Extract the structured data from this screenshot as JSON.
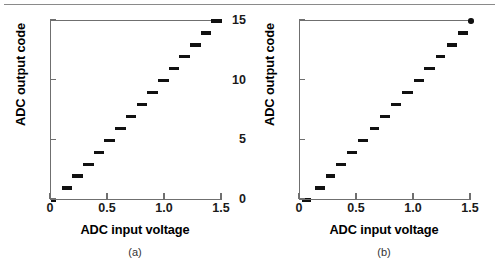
{
  "figure": {
    "divider_color": "#8a8a8a",
    "axis_color": "#6f6f6f",
    "data_color": "#111111"
  },
  "panels": [
    {
      "id": "a",
      "caption": "(a)",
      "xlabel": "ADC input voltage",
      "ylabel": "ADC output code"
    },
    {
      "id": "b",
      "caption": "(b)",
      "xlabel": "ADC input voltage",
      "ylabel": "ADC output code"
    }
  ],
  "ticks": {
    "x_labels": [
      "0",
      "0.5",
      "1.0",
      "1.5"
    ],
    "x_values": [
      0,
      0.5,
      1.0,
      1.5
    ],
    "y_labels": [
      "0",
      "5",
      "10",
      "15"
    ],
    "y_values": [
      0,
      5,
      10,
      15
    ]
  },
  "chart_data": [
    {
      "type": "line",
      "title": "(a)",
      "xlabel": "ADC input voltage",
      "ylabel": "ADC output code",
      "xlim": [
        0,
        1.5
      ],
      "ylim": [
        0,
        15
      ],
      "grid": false,
      "legend": "none",
      "description": "Ideal ADC transfer characteristic: 16 uniform code steps forming a staircase from code 0 to code 15 across 0 to 1.5 V input.",
      "series": [
        {
          "name": "ideal ADC transfer curve",
          "style": "staircase-steps",
          "steps": [
            {
              "code": 0,
              "x_start": 0.0,
              "x_end": 0.047
            },
            {
              "code": 1,
              "x_start": 0.094,
              "x_end": 0.188
            },
            {
              "code": 2,
              "x_start": 0.188,
              "x_end": 0.281
            },
            {
              "code": 3,
              "x_start": 0.281,
              "x_end": 0.375
            },
            {
              "code": 4,
              "x_start": 0.375,
              "x_end": 0.469
            },
            {
              "code": 5,
              "x_start": 0.469,
              "x_end": 0.562
            },
            {
              "code": 6,
              "x_start": 0.562,
              "x_end": 0.656
            },
            {
              "code": 7,
              "x_start": 0.656,
              "x_end": 0.75
            },
            {
              "code": 8,
              "x_start": 0.75,
              "x_end": 0.844
            },
            {
              "code": 9,
              "x_start": 0.844,
              "x_end": 0.938
            },
            {
              "code": 10,
              "x_start": 0.938,
              "x_end": 1.031
            },
            {
              "code": 11,
              "x_start": 1.031,
              "x_end": 1.125
            },
            {
              "code": 12,
              "x_start": 1.125,
              "x_end": 1.219
            },
            {
              "code": 13,
              "x_start": 1.219,
              "x_end": 1.312
            },
            {
              "code": 14,
              "x_start": 1.312,
              "x_end": 1.406
            },
            {
              "code": 15,
              "x_start": 1.406,
              "x_end": 1.5
            }
          ]
        }
      ]
    },
    {
      "type": "line",
      "title": "(b)",
      "xlabel": "ADC input voltage",
      "ylabel": "ADC output code",
      "xlim": [
        0,
        1.5
      ],
      "ylim": [
        0,
        15
      ],
      "grid": false,
      "legend": "none",
      "description": "Non-ideal ADC transfer characteristic: staircase with non-uniform code widths (differential nonlinearity), ending with a marker dot at code 15 near 1.5 V.",
      "end_marker": {
        "x": 1.5,
        "y": 15,
        "shape": "dot"
      },
      "series": [
        {
          "name": "non-ideal ADC transfer curve",
          "style": "staircase-steps",
          "steps": [
            {
              "code": 0,
              "x_start": 0.02,
              "x_end": 0.1
            },
            {
              "code": 1,
              "x_start": 0.13,
              "x_end": 0.215
            },
            {
              "code": 2,
              "x_start": 0.23,
              "x_end": 0.31
            },
            {
              "code": 3,
              "x_start": 0.32,
              "x_end": 0.405
            },
            {
              "code": 4,
              "x_start": 0.415,
              "x_end": 0.5
            },
            {
              "code": 5,
              "x_start": 0.505,
              "x_end": 0.6
            },
            {
              "code": 6,
              "x_start": 0.61,
              "x_end": 0.69
            },
            {
              "code": 7,
              "x_start": 0.7,
              "x_end": 0.79
            },
            {
              "code": 8,
              "x_start": 0.8,
              "x_end": 0.885
            },
            {
              "code": 9,
              "x_start": 0.895,
              "x_end": 0.995
            },
            {
              "code": 10,
              "x_start": 1.0,
              "x_end": 1.085
            },
            {
              "code": 11,
              "x_start": 1.09,
              "x_end": 1.18
            },
            {
              "code": 12,
              "x_start": 1.19,
              "x_end": 1.275
            },
            {
              "code": 13,
              "x_start": 1.29,
              "x_end": 1.375
            },
            {
              "code": 14,
              "x_start": 1.385,
              "x_end": 1.47
            },
            {
              "code": 15,
              "x_start": 1.485,
              "x_end": 1.5
            }
          ]
        }
      ]
    }
  ]
}
